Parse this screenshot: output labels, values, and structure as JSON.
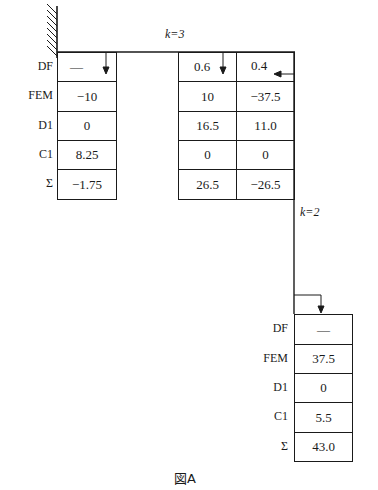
{
  "diagram": {
    "type": "moment-distribution-table",
    "caption": "図A",
    "row_labels": [
      "DF",
      "FEM",
      "D1",
      "C1",
      "Σ"
    ],
    "members": {
      "beam_stiffness_label": "k=3",
      "column_stiffness_label": "k=2"
    },
    "joint_left_fixed": {
      "support": "fixed",
      "columns": [
        {
          "DF": "—",
          "FEM": "−10",
          "D1": "0",
          "C1": "8.25",
          "Sum": "−1.75"
        }
      ]
    },
    "joint_right": {
      "columns": [
        {
          "DF": "0.6",
          "FEM": "10",
          "D1": "16.5",
          "C1": "0",
          "Sum": "26.5"
        },
        {
          "DF": "0.4",
          "FEM": "−37.5",
          "D1": "11.0",
          "C1": "0",
          "Sum": "−26.5"
        }
      ]
    },
    "joint_bottom": {
      "columns": [
        {
          "DF": "—",
          "FEM": "37.5",
          "D1": "0",
          "C1": "5.5",
          "Sum": "43.0"
        }
      ]
    }
  }
}
